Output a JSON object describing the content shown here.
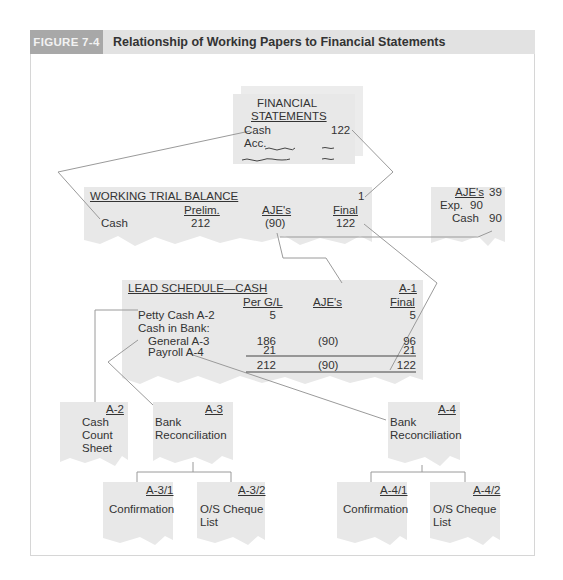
{
  "header": {
    "figure_label": "FIGURE 7-4",
    "title": "Relationship of Working Papers to Financial Statements"
  },
  "colors": {
    "paper": "#e8e8e8",
    "line": "#9a9a9a",
    "header_dark": "#a8a8a8",
    "header_light": "#e2e2e2"
  },
  "financial_statements": {
    "title_line1": "FINANCIAL",
    "title_line2": "STATEMENTS",
    "cash_label": "Cash",
    "cash_value": "122",
    "acc_label": "Acc."
  },
  "working_trial_balance": {
    "title": "WORKING TRIAL BALANCE",
    "ref": "1",
    "columns": [
      "Prelim.",
      "AJE's",
      "Final"
    ],
    "row_label": "Cash",
    "values": [
      "212",
      "(90)",
      "122"
    ]
  },
  "aje": {
    "title": "AJE's",
    "ref": "39",
    "lines": [
      {
        "label": "Exp.",
        "value": "90"
      },
      {
        "label": "Cash",
        "value": "90"
      }
    ]
  },
  "lead_schedule": {
    "title": "LEAD SCHEDULE—CASH",
    "ref": "A-1",
    "columns": [
      "Per G/L",
      "AJE's",
      "Final"
    ],
    "rows": [
      {
        "label": "Petty Cash A-2",
        "per_gl": "5",
        "aje": "",
        "final": "5"
      },
      {
        "label": "Cash in Bank:",
        "per_gl": "",
        "aje": "",
        "final": ""
      },
      {
        "label": "General A-3",
        "per_gl": "186",
        "aje": "(90)",
        "final": "96"
      },
      {
        "label": "Payroll A-4",
        "per_gl": "21",
        "aje": "",
        "final": "21"
      }
    ],
    "totals": {
      "per_gl": "212",
      "aje": "(90)",
      "final": "122"
    }
  },
  "schedules": {
    "a2": {
      "ref": "A-2",
      "line1": "Cash",
      "line2": "Count",
      "line3": "Sheet"
    },
    "a3": {
      "ref": "A-3",
      "line1": "Bank",
      "line2": "Reconciliation"
    },
    "a4": {
      "ref": "A-4",
      "line1": "Bank",
      "line2": "Reconciliation"
    },
    "a31": {
      "ref": "A-3/1",
      "line1": "Confirmation"
    },
    "a32": {
      "ref": "A-3/2",
      "line1": "O/S Cheque",
      "line2": "List"
    },
    "a41": {
      "ref": "A-4/1",
      "line1": "Confirmation"
    },
    "a42": {
      "ref": "A-4/2",
      "line1": "O/S Cheque",
      "line2": "List"
    }
  }
}
